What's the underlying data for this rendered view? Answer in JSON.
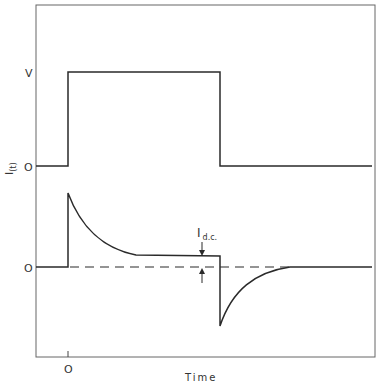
{
  "figure": {
    "y_axis_label": "I",
    "y_axis_label_sub": "(t)",
    "x_axis_label": "Time",
    "x_tick_zero": "O",
    "upper_trace": {
      "level_high_label": "V",
      "level_zero_label": "O",
      "description": "Applied voltage step: 0 before t=0, V during pulse, back to 0"
    },
    "lower_trace": {
      "level_zero_label": "O",
      "annotation_main": "I",
      "annotation_sub": "d.c.",
      "description": "Current response: charging spike decaying to steady d.c. level, negative spike on switch-off decaying to zero"
    },
    "colors": {
      "line": "#2a2a2a",
      "frame": "#555555",
      "text": "#333333"
    }
  }
}
